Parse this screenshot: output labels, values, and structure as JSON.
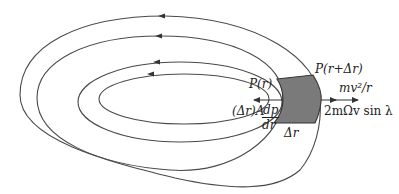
{
  "diagram": {
    "colors": {
      "line": "#4a4a4a",
      "shade": "#7a7a7a",
      "text": "#222222"
    },
    "labels": {
      "p_r": "P(r)",
      "p_r_dr": "P(r+Δr)",
      "centrifugal": "mv²/r",
      "coriolis": "2mΩv sin λ",
      "pressure_force_prefix": "(Δr)A",
      "pressure_force_num": "dp",
      "pressure_force_den": "dr",
      "delta_r": "Δr"
    },
    "curves": [
      {
        "name": "outer-isobar-1"
      },
      {
        "name": "outer-isobar-2"
      },
      {
        "name": "inner-isobar-1"
      },
      {
        "name": "inner-isobar-2"
      }
    ],
    "arrows": [
      {
        "name": "pressure-gradient-arrow",
        "direction": "left"
      },
      {
        "name": "centrifugal-arrow",
        "direction": "right"
      },
      {
        "name": "coriolis-arrow",
        "direction": "right"
      }
    ]
  }
}
